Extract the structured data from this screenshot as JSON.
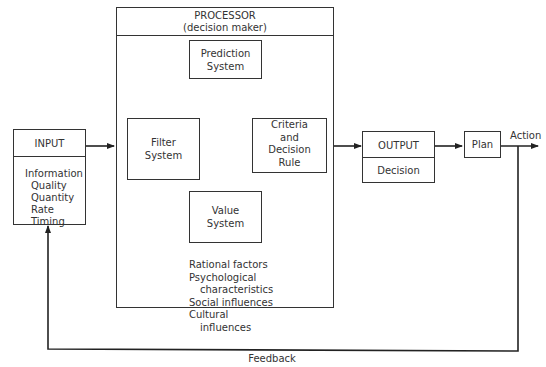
{
  "processor": {
    "title": "PROCESSOR",
    "subtitle": "(decision maker)",
    "factors": [
      {
        "text": "Rational factors",
        "indent": false
      },
      {
        "text": "Psychological",
        "indent": false
      },
      {
        "text": "characteristics",
        "indent": true
      },
      {
        "text": "Social influences",
        "indent": false
      },
      {
        "text": "Cultural",
        "indent": false
      },
      {
        "text": "influences",
        "indent": true
      }
    ]
  },
  "input": {
    "title": "INPUT",
    "items": [
      {
        "text": "Information",
        "indent": false
      },
      {
        "text": "Quality",
        "indent": true
      },
      {
        "text": "Quantity",
        "indent": true
      },
      {
        "text": "Rate",
        "indent": true
      },
      {
        "text": "Timing",
        "indent": true
      }
    ]
  },
  "filter": {
    "line1": "Filter",
    "line2": "System"
  },
  "prediction": {
    "line1": "Prediction",
    "line2": "System"
  },
  "value": {
    "line1": "Value",
    "line2": "System"
  },
  "criteria": {
    "line1": "Criteria",
    "line2": "and",
    "line3": "Decision",
    "line4": "Rule"
  },
  "output": {
    "title": "OUTPUT",
    "body": "Decision"
  },
  "plan": {
    "label": "Plan"
  },
  "action": {
    "label": "Action"
  },
  "feedback": {
    "label": "Feedback"
  }
}
